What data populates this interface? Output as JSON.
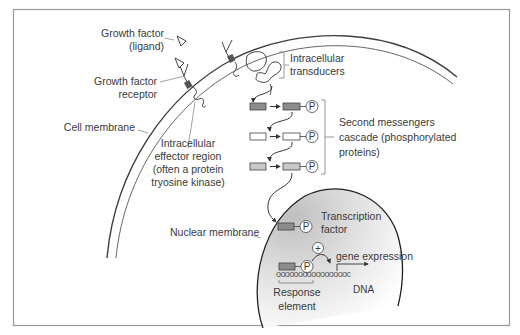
{
  "figure": {
    "colors": {
      "frame": "#9a9a9a",
      "membrane": "#4a4a4a",
      "membrane_inner": "#6a6a6a",
      "leader": "#8a8a8a",
      "text": "#3a3a3a",
      "box_dark": "#8c8c8c",
      "box_light": "#c8c8c8",
      "box_white": "#ffffff",
      "nucleus_gradient_dark": "#c4c4c4",
      "nucleus_gradient_light": "#ffffff"
    }
  },
  "labels": {
    "growth_factor_ligand": [
      "Growth factor",
      "(ligand)"
    ],
    "growth_factor_receptor": [
      "Growth factor",
      "receptor"
    ],
    "cell_membrane": "Cell membrane",
    "intracellular_effector": [
      "Intracellular",
      "effector region",
      "(often a protein",
      "tryosine kinase)"
    ],
    "intracellular_transducers": [
      "Intracellular",
      "transducers"
    ],
    "second_messengers": [
      "Second messengers",
      "cascade (phosphorylated",
      "proteins)"
    ],
    "transcription_factor": [
      "Transcription",
      "factor"
    ],
    "nuclear_membrane": "Nuclear membrane",
    "plus_sign": "+",
    "gene_expression": "gene expression",
    "dna": "DNA",
    "response_element": [
      "Response",
      "element"
    ],
    "phosphate": "P"
  },
  "cascade": {
    "rows": [
      {
        "fill": "dark",
        "phosphorylated": true
      },
      {
        "fill": "white",
        "phosphorylated": true
      },
      {
        "fill": "light",
        "phosphorylated": true
      }
    ]
  },
  "dna_sequence": "ooooooooooooooooc"
}
